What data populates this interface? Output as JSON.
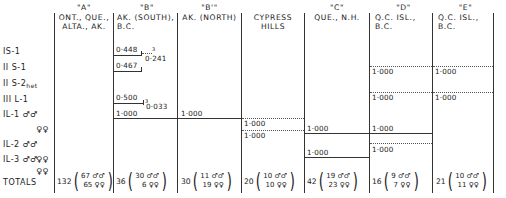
{
  "table": {
    "columns": [
      {
        "key": "A",
        "tag": "\"A\"",
        "line1": "ONT., QUE.,",
        "line2": "ALTA., AK."
      },
      {
        "key": "B",
        "tag": "\"B\"",
        "line1": "AK. (SOUTH),",
        "line2": "B.C."
      },
      {
        "key": "B'",
        "tag": "\"B'\"",
        "line1": "AK. (NORTH)",
        "line2": ""
      },
      {
        "key": "CH",
        "tag": "",
        "line1": "CYPRESS",
        "line2": "HILLS"
      },
      {
        "key": "C",
        "tag": "\"C\"",
        "line1": "QUE., N.H.",
        "line2": ""
      },
      {
        "key": "D",
        "tag": "\"D\"",
        "line1": "Q.C. ISL.,",
        "line2": "B.C."
      },
      {
        "key": "E",
        "tag": "\"E\"",
        "line1": "Q.C. ISL.,",
        "line2": "B.C."
      }
    ],
    "rows": [
      {
        "label": "IS-1",
        "sub": ""
      },
      {
        "label": "II S-1",
        "sub": ""
      },
      {
        "label": "II S-2",
        "sub": "het"
      },
      {
        "label": "III L-1",
        "sub": ""
      },
      {
        "label": "IL-1 ♂♂",
        "sub": ""
      },
      {
        "label": "♀♀",
        "sub": ""
      },
      {
        "label": "IL-2 ♂♂",
        "sub": ""
      },
      {
        "label": "♀♀",
        "sub": ""
      },
      {
        "label": "IL-3 ♂♂",
        "sub": ""
      },
      {
        "label": "♀♀",
        "sub": ""
      },
      {
        "label": "TOTALS",
        "sub": ""
      }
    ],
    "values": {
      "B_IS1": "0·448",
      "B_IS1_bracket": "0·241",
      "B_IS1_sup": "3",
      "B_IIS1": "0·467",
      "B_IIIL1": "0·500",
      "B_IIIL1_bracket": "0·033",
      "B_IIIL1_sup": "3",
      "B_IL1": "1·000",
      "Bp_IL1": "1·000",
      "CH_IL1_m": "1·000",
      "CH_IL1_f": "1·000",
      "C_IL2": "1·000",
      "C_IL3": "1·000",
      "D_IIS2": "1·000",
      "D_IIIL1": "1·000",
      "D_IL2": "1·000",
      "D_IL3": "1·000",
      "E_IIS2": "1·000",
      "E_IIIL1": "1·000"
    },
    "totals": [
      {
        "col": "A",
        "total": "132",
        "males": "67",
        "females": "65"
      },
      {
        "col": "B",
        "total": "36",
        "males": "30",
        "females": "6"
      },
      {
        "col": "B'",
        "total": "30",
        "males": "11",
        "females": "19"
      },
      {
        "col": "CH",
        "total": "20",
        "males": "10",
        "females": "10"
      },
      {
        "col": "C",
        "total": "42",
        "males": "19",
        "females": "23"
      },
      {
        "col": "D",
        "total": "16",
        "males": "9",
        "females": "7"
      },
      {
        "col": "E",
        "total": "21",
        "males": "10",
        "females": "11"
      }
    ],
    "symbols": {
      "males": "♂♂",
      "females": "♀♀",
      "open": "(",
      "close": ")"
    }
  }
}
